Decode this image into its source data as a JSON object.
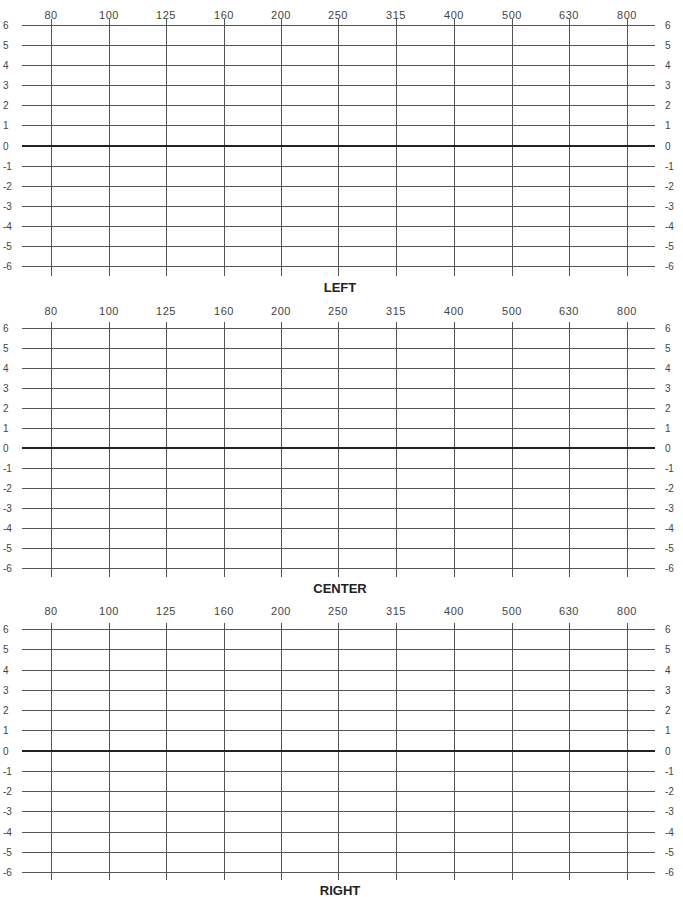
{
  "chart_data": [
    {
      "type": "line",
      "title": "LEFT",
      "xlabel": "",
      "ylabel": "",
      "x_ticks": [
        "80",
        "100",
        "125",
        "160",
        "200",
        "250",
        "315",
        "400",
        "500",
        "630",
        "800"
      ],
      "y_ticks": [
        6,
        5,
        4,
        3,
        2,
        1,
        0,
        -1,
        -2,
        -3,
        -4,
        -5,
        -6
      ],
      "ylim": [
        -6,
        6
      ],
      "grid": true,
      "series": []
    },
    {
      "type": "line",
      "title": "CENTER",
      "xlabel": "",
      "ylabel": "",
      "x_ticks": [
        "80",
        "100",
        "125",
        "160",
        "200",
        "250",
        "315",
        "400",
        "500",
        "630",
        "800"
      ],
      "y_ticks": [
        6,
        5,
        4,
        3,
        2,
        1,
        0,
        -1,
        -2,
        -3,
        -4,
        -5,
        -6
      ],
      "ylim": [
        -6,
        6
      ],
      "grid": true,
      "series": []
    },
    {
      "type": "line",
      "title": "RIGHT",
      "xlabel": "",
      "ylabel": "",
      "x_ticks": [
        "80",
        "100",
        "125",
        "160",
        "200",
        "250",
        "315",
        "400",
        "500",
        "630",
        "800"
      ],
      "y_ticks": [
        6,
        5,
        4,
        3,
        2,
        1,
        0,
        -1,
        -2,
        -3,
        -4,
        -5,
        -6
      ],
      "ylim": [
        -6,
        6
      ],
      "grid": true,
      "series": []
    }
  ],
  "charts": [
    {
      "title": "LEFT"
    },
    {
      "title": "CENTER"
    },
    {
      "title": "RIGHT"
    }
  ],
  "x_ticks": [
    "80",
    "100",
    "125",
    "160",
    "200",
    "250",
    "315",
    "400",
    "500",
    "630",
    "800"
  ],
  "y_ticks": [
    "6",
    "5",
    "4",
    "3",
    "2",
    "1",
    "0",
    "-1",
    "-2",
    "-3",
    "-4",
    "-5",
    "-6"
  ]
}
